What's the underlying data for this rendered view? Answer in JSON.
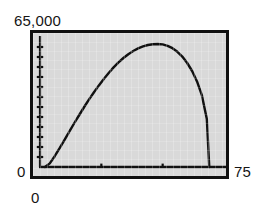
{
  "chart_data": {
    "type": "line",
    "title": "",
    "subtitle": "",
    "xlabel": "",
    "ylabel": "",
    "xlim": [
      0,
      75
    ],
    "ylim": [
      0,
      65000
    ],
    "grid": false,
    "legend": null,
    "style": "graphing-calculator",
    "annotations": [],
    "axis_labels": {
      "y_max": "65,000",
      "y_min": "0",
      "x_min": "0",
      "x_max": "75"
    },
    "ticks": {
      "y_tick_count": 12,
      "y_tick_values": [
        5000,
        10000,
        15000,
        20000,
        25000,
        30000,
        35000,
        40000,
        45000,
        50000,
        55000,
        60000
      ],
      "x_tick_values": [
        25,
        50
      ],
      "x_tick_count": 2
    },
    "series": [
      {
        "name": "curve",
        "x": [
          2,
          4,
          6,
          8,
          10,
          12,
          14,
          16,
          18,
          20,
          22,
          24,
          26,
          28,
          30,
          32,
          34,
          36,
          38,
          40,
          42,
          44,
          46,
          48,
          50,
          52,
          54,
          56,
          58,
          60,
          62,
          64,
          66,
          68,
          69
        ],
        "values": [
          0,
          1800,
          5400,
          9400,
          13600,
          17800,
          22000,
          26000,
          30000,
          33800,
          37400,
          40800,
          44000,
          47000,
          49800,
          52300,
          54500,
          56400,
          58000,
          59300,
          60300,
          61000,
          61400,
          61500,
          61300,
          60600,
          59400,
          57600,
          55200,
          52000,
          48000,
          42800,
          35800,
          24000,
          0
        ]
      }
    ],
    "colors": {
      "plot_background": "#d9d9d9",
      "frame": "#101010",
      "curve": "#101010",
      "page_background": "#ffffff",
      "text": "#151515"
    }
  },
  "labels": {
    "y_max": "65,000",
    "y_zero": "0",
    "x_zero": "0",
    "x_max": "75"
  }
}
